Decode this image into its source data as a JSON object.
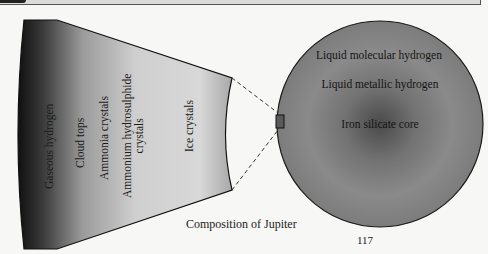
{
  "figure": {
    "caption": "Composition of Jupiter",
    "page_number": "117",
    "atmosphere_section": {
      "layers": [
        {
          "label": "Gaseous hydrogen"
        },
        {
          "label": "Cloud tops"
        },
        {
          "label": "Ammonia crystals"
        },
        {
          "label_line1": "Ammonium hydrosulphide",
          "label_line2": "crystals"
        },
        {
          "label": "Ice crystals"
        }
      ]
    },
    "planet_cross_section": {
      "layers": [
        {
          "label": "Liquid molecular hydrogen"
        },
        {
          "label": "Liquid metallic hydrogen"
        },
        {
          "label": "Iron silicate core"
        }
      ]
    }
  },
  "colors": {
    "background": "#f7f7f5",
    "wedge_dark": "#151515",
    "wedge_light": "#dedede",
    "sphere_outer": "#8c8c8c",
    "sphere_core": "#4a4a4a"
  }
}
